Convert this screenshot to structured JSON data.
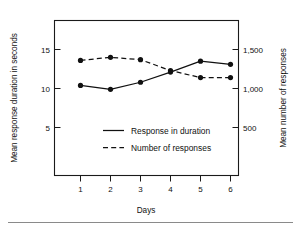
{
  "chart_data": {
    "type": "line",
    "title": "",
    "xlabel": "Days",
    "ylabel": "Mean response duration in seconds",
    "y2label": "Mean number of responses",
    "categories": [
      "1",
      "2",
      "3",
      "4",
      "5",
      "6"
    ],
    "x": [
      1,
      2,
      3,
      4,
      5,
      6
    ],
    "xlim": [
      0.5,
      6.5
    ],
    "ylim": [
      0,
      17.5
    ],
    "y2lim": [
      0,
      1750
    ],
    "yticks": [
      5,
      10,
      15
    ],
    "ytick_labels": [
      "5",
      "10",
      "15"
    ],
    "y2ticks": [
      500,
      1000,
      1500
    ],
    "y2tick_labels": [
      "500",
      "1,000",
      "1,500"
    ],
    "xticks": [
      1,
      2,
      3,
      4,
      5,
      6
    ],
    "xtick_labels": [
      "1",
      "2",
      "3",
      "4",
      "5",
      "6"
    ],
    "grid": false,
    "legend_position": "center",
    "series": [
      {
        "name": "Response in duration",
        "axis": "left",
        "style": "solid",
        "marker": "filled-circle",
        "values": [
          10.4,
          9.9,
          10.8,
          12.1,
          13.5,
          13.1
        ]
      },
      {
        "name": "Number of responses",
        "axis": "right",
        "style": "dashed",
        "marker": "filled-circle",
        "values": [
          1360,
          1400,
          1370,
          1230,
          1140,
          1140
        ]
      }
    ]
  },
  "axes": {
    "left_title": "Mean response duration in seconds",
    "right_title": "Mean number of responses",
    "bottom_title": "Days"
  },
  "ticks": {
    "left": [
      "15",
      "10",
      "5"
    ],
    "right": [
      "1,500",
      "1,000",
      "500"
    ],
    "bottom": [
      "1",
      "2",
      "3",
      "4",
      "5",
      "6"
    ]
  },
  "legend": {
    "entries": [
      {
        "label": "Response in duration",
        "style": "solid"
      },
      {
        "label": "Number of responses",
        "style": "dashed"
      }
    ]
  }
}
